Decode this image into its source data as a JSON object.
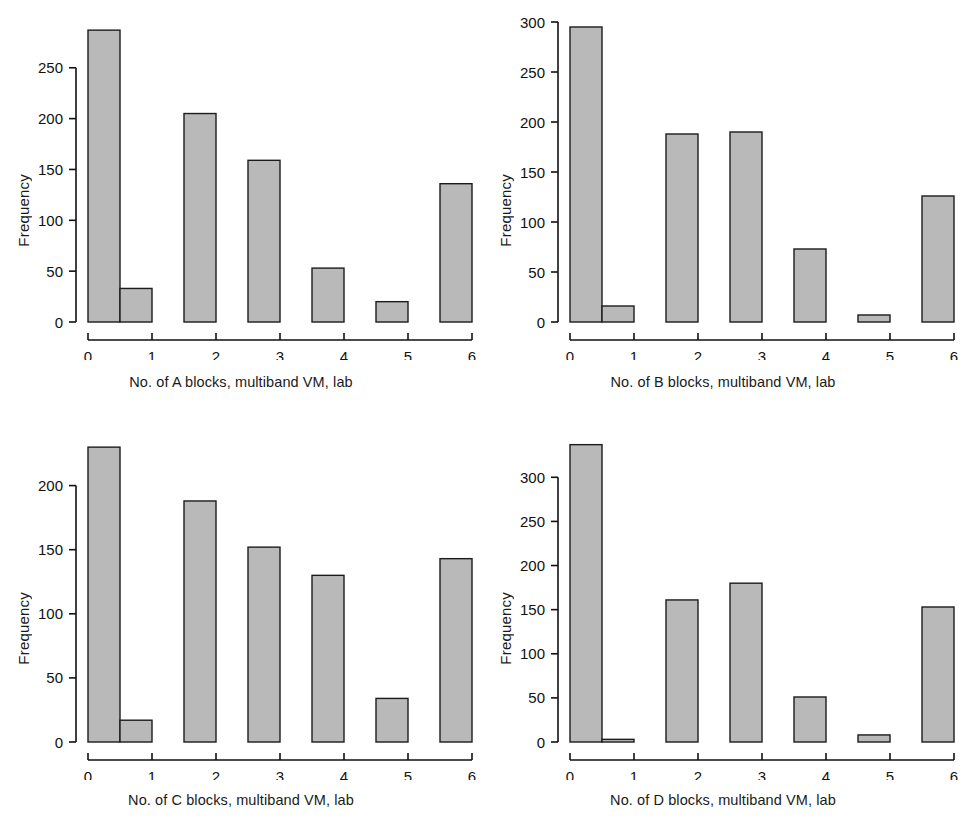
{
  "figure": {
    "kind": "histogram-panel-grid",
    "panel_count": 4,
    "bar_fill": "#b9b9b9",
    "bar_edge": "#1c1c1c",
    "axis_color": "#111111",
    "background": "#ffffff"
  },
  "chart_data": [
    {
      "id": "panel-a",
      "type": "bar",
      "title": "",
      "xlabel": "No. of A blocks, multiband VM, lab",
      "ylabel": "Frequency",
      "categories": [
        "0",
        "1",
        "2",
        "3",
        "4",
        "5",
        "6"
      ],
      "bin_starts": [
        0,
        0.5,
        1.5,
        2.5,
        3.5,
        4.5,
        5.5
      ],
      "bin_width": 0.5,
      "values": [
        287,
        33,
        205,
        159,
        53,
        20,
        136
      ],
      "xlim": [
        0,
        6
      ],
      "ylim": [
        0,
        295
      ],
      "xticks": [
        0,
        1,
        2,
        3,
        4,
        5,
        6
      ],
      "yticks": [
        0,
        50,
        100,
        150,
        200,
        250
      ],
      "ytick_labels": [
        "0",
        "50",
        "100",
        "150",
        "200",
        "250"
      ],
      "grid": false,
      "legend": "none"
    },
    {
      "id": "panel-b",
      "type": "bar",
      "title": "",
      "xlabel": "No. of B blocks, multiband VM, lab",
      "ylabel": "Frequency",
      "categories": [
        "0",
        "1",
        "2",
        "3",
        "4",
        "5",
        "6"
      ],
      "bin_starts": [
        0,
        0.5,
        1.5,
        2.5,
        3.5,
        4.5,
        5.5
      ],
      "bin_width": 0.5,
      "values": [
        295,
        16,
        188,
        190,
        73,
        7,
        126
      ],
      "xlim": [
        0,
        6
      ],
      "ylim": [
        0,
        300
      ],
      "xticks": [
        0,
        1,
        2,
        3,
        4,
        5,
        6
      ],
      "yticks": [
        0,
        50,
        100,
        150,
        200,
        250,
        300
      ],
      "ytick_labels": [
        "0",
        "50",
        "100",
        "150",
        "200",
        "250",
        "300"
      ],
      "grid": false,
      "legend": "none"
    },
    {
      "id": "panel-c",
      "type": "bar",
      "title": "",
      "xlabel": "No. of C blocks, multiband VM, lab",
      "ylabel": "Frequency",
      "categories": [
        "0",
        "1",
        "2",
        "3",
        "4",
        "5",
        "6"
      ],
      "bin_starts": [
        0,
        0.5,
        1.5,
        2.5,
        3.5,
        4.5,
        5.5
      ],
      "bin_width": 0.5,
      "values": [
        230,
        17,
        188,
        152,
        130,
        34,
        143
      ],
      "xlim": [
        0,
        6
      ],
      "ylim": [
        0,
        234
      ],
      "xticks": [
        0,
        1,
        2,
        3,
        4,
        5,
        6
      ],
      "yticks": [
        0,
        50,
        100,
        150,
        200
      ],
      "ytick_labels": [
        "0",
        "50",
        "100",
        "150",
        "200"
      ],
      "grid": false,
      "legend": "none"
    },
    {
      "id": "panel-d",
      "type": "bar",
      "title": "",
      "xlabel": "No. of D blocks, multiband VM, lab",
      "ylabel": "Frequency",
      "categories": [
        "0",
        "1",
        "2",
        "3",
        "4",
        "5",
        "6"
      ],
      "bin_starts": [
        0,
        0.5,
        1.5,
        2.5,
        3.5,
        4.5,
        5.5
      ],
      "bin_width": 0.5,
      "values": [
        337,
        3,
        161,
        180,
        51,
        8,
        153
      ],
      "xlim": [
        0,
        6
      ],
      "ylim": [
        0,
        340
      ],
      "xticks": [
        0,
        1,
        2,
        3,
        4,
        5,
        6
      ],
      "yticks": [
        0,
        50,
        100,
        150,
        200,
        250,
        300
      ],
      "ytick_labels": [
        "0",
        "50",
        "100",
        "150",
        "200",
        "250",
        "300"
      ],
      "grid": false,
      "legend": "none"
    }
  ]
}
